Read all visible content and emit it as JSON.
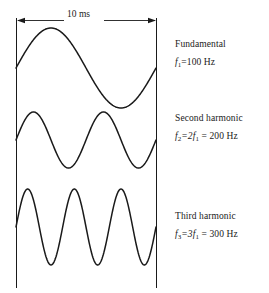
{
  "figure": {
    "background_color": "#ffffff",
    "line_color": "#1a1a1a",
    "dimension": {
      "label": "10 ms",
      "icon_left": "arrow-left-icon",
      "icon_right": "arrow-right-icon",
      "x_start": 16,
      "x_end": 156
    },
    "labels": [
      {
        "title": "Fundamental",
        "eq_var": "f",
        "eq_sub": "1",
        "eq_rest": "=100 Hz"
      },
      {
        "title": "Second harmonic",
        "eq_var": "f",
        "eq_sub": "2",
        "eq_rest": "=2f",
        "eq_sub2": "1",
        "eq_rest2": " = 200 Hz"
      },
      {
        "title": "Third harmonic",
        "eq_var": "f",
        "eq_sub": "3",
        "eq_rest": "=3f",
        "eq_sub2": "1",
        "eq_rest2": " = 300 Hz"
      }
    ]
  },
  "chart_data": {
    "type": "line",
    "title": "",
    "subtitle": "",
    "xlabel": "",
    "ylabel": "",
    "xlim": [
      0,
      10
    ],
    "ylim": [
      -1,
      1
    ],
    "grid": false,
    "legend_position": "right",
    "x_unit": "ms",
    "span_label": "10 ms",
    "annotations": [
      "10 ms"
    ],
    "series": [
      {
        "name": "Fundamental",
        "frequency_hz": 100,
        "cycles_in_window": 1,
        "harmonic_number": 1,
        "amplitude": 1,
        "phase_deg": 0,
        "baseline_y": 68,
        "amplitude_px": 40,
        "legend_label": "Fundamental",
        "legend_equation": "f1 = 100 Hz"
      },
      {
        "name": "Second harmonic",
        "frequency_hz": 200,
        "cycles_in_window": 2,
        "harmonic_number": 2,
        "amplitude": 1,
        "phase_deg": 0,
        "baseline_y": 140,
        "amplitude_px": 28,
        "legend_label": "Second harmonic",
        "legend_equation": "f2 = 2f1 = 200 Hz"
      },
      {
        "name": "Third harmonic",
        "frequency_hz": 300,
        "cycles_in_window": 3,
        "harmonic_number": 3,
        "amplitude": 1,
        "phase_deg": 0,
        "baseline_y": 227,
        "amplitude_px": 38,
        "legend_label": "Third harmonic",
        "legend_equation": "f3 = 3f1 = 300 Hz"
      }
    ]
  }
}
